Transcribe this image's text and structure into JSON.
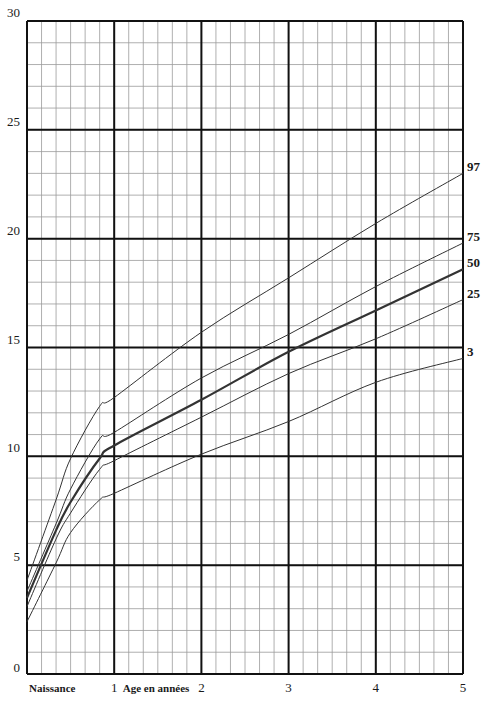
{
  "chart_data": {
    "type": "line",
    "title": "",
    "xlabel": "Age en années",
    "ylabel": "",
    "x_origin_label": "Naissance",
    "xlim": [
      0,
      5
    ],
    "ylim": [
      0,
      30
    ],
    "x_ticks": [
      {
        "value": 0,
        "label": "Naissance"
      },
      {
        "value": 1,
        "label": "1"
      },
      {
        "value": 2,
        "label": "2"
      },
      {
        "value": 3,
        "label": "3"
      },
      {
        "value": 4,
        "label": "4"
      },
      {
        "value": 5,
        "label": "5"
      }
    ],
    "y_ticks": [
      {
        "value": 0,
        "label": "0"
      },
      {
        "value": 5,
        "label": "5"
      },
      {
        "value": 10,
        "label": "10"
      },
      {
        "value": 15,
        "label": "15"
      },
      {
        "value": 20,
        "label": "20"
      },
      {
        "value": 25,
        "label": "25"
      },
      {
        "value": 30,
        "label": "30"
      }
    ],
    "grid": {
      "major_x_step": 1,
      "minor_x_step": 0.1667,
      "major_y_step": 5,
      "minor_y_step": 1
    },
    "legend_position": "right-end labels",
    "x": [
      0,
      0.333,
      0.5,
      0.833,
      1,
      2,
      3,
      4,
      5
    ],
    "series": [
      {
        "name": "97",
        "label": "97",
        "values": [
          4.3,
          8.0,
          9.9,
          12.3,
          12.7,
          15.7,
          18.2,
          20.7,
          23.0
        ],
        "width": 1
      },
      {
        "name": "75",
        "label": "75",
        "values": [
          3.8,
          6.9,
          8.5,
          10.8,
          11.1,
          13.6,
          15.6,
          17.8,
          19.8
        ],
        "width": 1
      },
      {
        "name": "50",
        "label": "50",
        "values": [
          3.5,
          6.6,
          7.9,
          9.9,
          10.5,
          12.6,
          14.8,
          16.7,
          18.6
        ],
        "width": 2.2
      },
      {
        "name": "25",
        "label": "25",
        "values": [
          3.1,
          6.2,
          7.4,
          9.4,
          9.8,
          11.8,
          13.8,
          15.4,
          17.2
        ],
        "width": 1
      },
      {
        "name": "3",
        "label": "3",
        "values": [
          2.4,
          5.1,
          6.5,
          8.0,
          8.3,
          10.1,
          11.6,
          13.4,
          14.5
        ],
        "width": 1
      }
    ]
  },
  "colors": {
    "background": "#ffffff",
    "major_grid": "#111111",
    "minor_grid": "#9a9a9a",
    "curve": "#333333",
    "text": "#1a1a1a"
  }
}
